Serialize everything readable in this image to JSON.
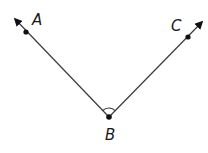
{
  "diagram": {
    "type": "geometry-angle",
    "colors": {
      "stroke": "#3a3a3a",
      "point": "#111111",
      "label": "#1a1a1a"
    },
    "vertex": {
      "label": "B",
      "x": 109,
      "y": 117,
      "label_x": 110,
      "label_y": 140
    },
    "rays": [
      {
        "name": "ray-BA",
        "through": {
          "label": "A",
          "x": 26,
          "y": 32,
          "label_x": 35,
          "label_y": 24
        },
        "tip": {
          "x": 15,
          "y": 19
        }
      },
      {
        "name": "ray-BC",
        "through": {
          "label": "C",
          "x": 188,
          "y": 37,
          "label_x": 172,
          "label_y": 30
        },
        "tip": {
          "x": 202,
          "y": 22
        }
      }
    ],
    "angle_arc": {
      "radius": 9
    }
  }
}
